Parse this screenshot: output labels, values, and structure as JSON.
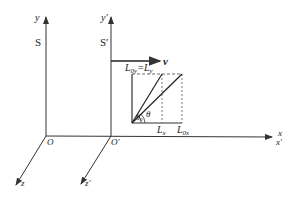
{
  "figure": {
    "frames": {
      "S": {
        "name": "S",
        "y_axis": "y",
        "x_axis": "x",
        "z_axis": "z",
        "origin": "O"
      },
      "S_prime": {
        "name": "S′",
        "y_axis": "y′",
        "x_axis": "x′",
        "z_axis": "z′",
        "origin": "O′"
      }
    },
    "velocity": {
      "label": "v"
    },
    "rod": {
      "label_top": "L",
      "label_top_sub": "0y",
      "label_top_eq": "=L",
      "label_top_eq_sub": "y",
      "label_Lx": "L",
      "label_Lx_sub": "x",
      "label_L0x": "L",
      "label_L0x_sub": "0x",
      "angle_inner": "θ",
      "angle_inner_sub": "0",
      "angle_outer": "θ"
    },
    "colors": {
      "line": "#333333",
      "text": "#222222"
    }
  }
}
